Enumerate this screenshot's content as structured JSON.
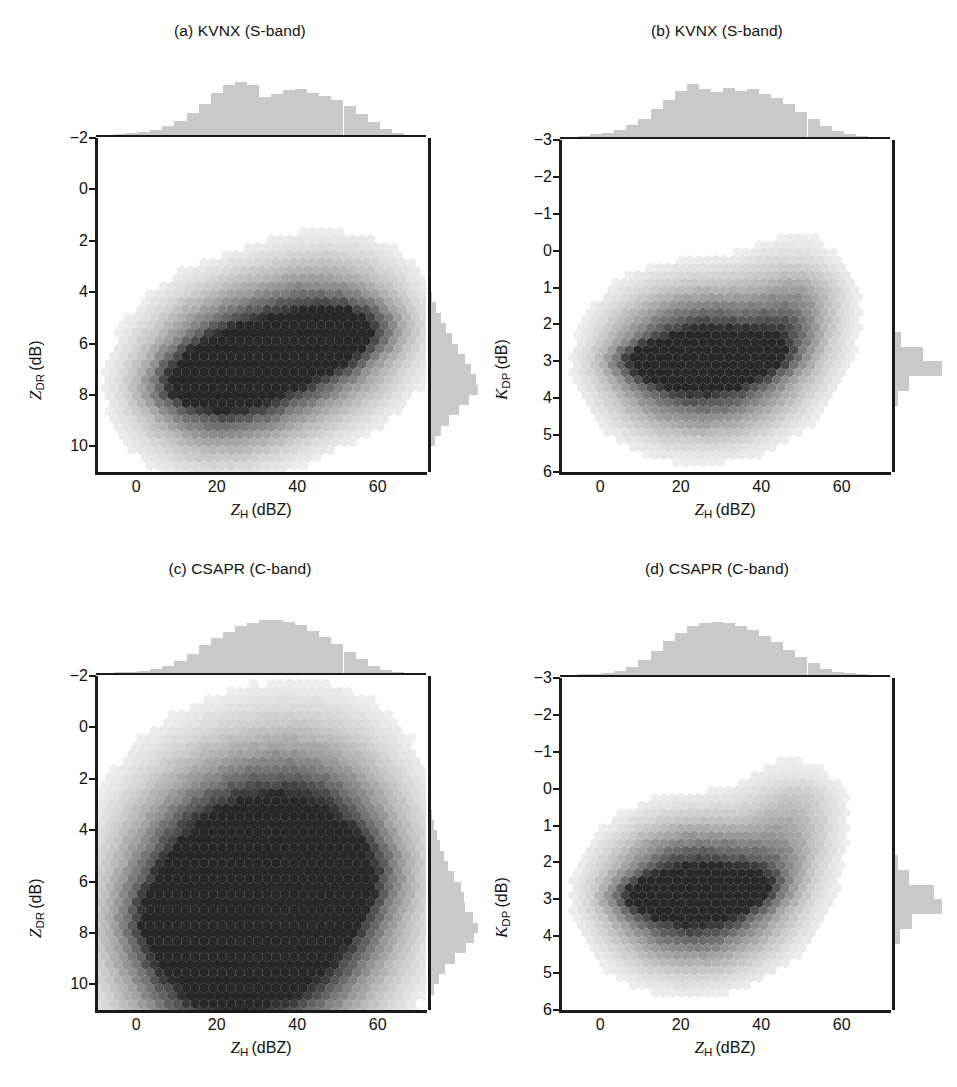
{
  "figure": {
    "caption_prefix": "",
    "panel_count": 4
  },
  "panels": [
    {
      "key": "a",
      "title": "(a) KVNX (S-band)",
      "xlabel_sym": "Z",
      "xlabel_sub": "H",
      "xlabel_unit": "(dBZ)",
      "ylabel_sym": "Z",
      "ylabel_sub": "DR",
      "ylabel_unit": "(dB)",
      "yticks": [
        "10",
        "8",
        "6",
        "4",
        "2",
        "0",
        "−2"
      ],
      "xticks": [
        "0",
        "20",
        "40",
        "60"
      ],
      "annotations": [
        "1",
        "2",
        "3"
      ]
    },
    {
      "key": "b",
      "title": "(b) KVNX (S-band)",
      "xlabel_sym": "Z",
      "xlabel_sub": "H",
      "xlabel_unit": "(dBZ)",
      "ylabel_sym": "K",
      "ylabel_sub": "DP",
      "ylabel_unit": "(dB)",
      "yticks": [
        "6",
        "5",
        "4",
        "3",
        "2",
        "1",
        "0",
        "−1",
        "−2",
        "−3"
      ],
      "xticks": [
        "0",
        "20",
        "40",
        "60"
      ],
      "annotations": [
        "5",
        "4"
      ]
    },
    {
      "key": "c",
      "title": "(c) CSAPR (C-band)",
      "xlabel_sym": "Z",
      "xlabel_sub": "H",
      "xlabel_unit": "(dBZ)",
      "ylabel_sym": "Z",
      "ylabel_sub": "DR",
      "ylabel_unit": "(dB)",
      "yticks": [
        "10",
        "8",
        "6",
        "4",
        "2",
        "0",
        "−2"
      ],
      "xticks": [
        "0",
        "20",
        "40",
        "60"
      ],
      "annotations": [
        "1",
        "2",
        "3"
      ]
    },
    {
      "key": "d",
      "title": "(d) CSAPR (C-band)",
      "xlabel_sym": "Z",
      "xlabel_sub": "H",
      "xlabel_unit": "(dBZ)",
      "ylabel_sym": "K",
      "ylabel_sub": "DP",
      "ylabel_unit": "(dB)",
      "yticks": [
        "6",
        "5",
        "4",
        "3",
        "2",
        "1",
        "0",
        "−1",
        "−2",
        "−3"
      ],
      "xticks": [
        "0",
        "20",
        "40",
        "60"
      ],
      "annotations": [
        "5",
        "4"
      ]
    }
  ],
  "colors": {
    "axis": "#1a1a1a",
    "histogram_fill": "#c9c9c9",
    "density_dark": "#2b2b2b",
    "text": "#111111",
    "background": "#ffffff"
  },
  "chart_data": [
    {
      "id": "a",
      "type": "heatmap",
      "title": "(a) KVNX (S-band)",
      "xlabel": "Z_H (dBZ)",
      "ylabel": "Z_DR (dB)",
      "xlim": [
        -10,
        72
      ],
      "ylim": [
        -3,
        10
      ],
      "xticks": [
        0,
        20,
        40,
        60
      ],
      "yticks": [
        -2,
        0,
        2,
        4,
        6,
        8,
        10
      ],
      "grid": false,
      "description": "2D joint frequency (hexbin) of differential reflectivity vs horizontal reflectivity; elongated ridge rising from (12 dBZ, 0.3 dB) to (58 dBZ, 2.8 dB); densest core near 20-28 dBZ at 0.5-1.2 dB.",
      "ridge_points": [
        {
          "x": 10,
          "y": 0.2,
          "density": 0.1
        },
        {
          "x": 14,
          "y": 0.4,
          "density": 0.3
        },
        {
          "x": 18,
          "y": 0.6,
          "density": 0.62
        },
        {
          "x": 22,
          "y": 0.8,
          "density": 0.95
        },
        {
          "x": 26,
          "y": 1.0,
          "density": 0.88
        },
        {
          "x": 30,
          "y": 1.3,
          "density": 0.66
        },
        {
          "x": 34,
          "y": 1.5,
          "density": 0.58
        },
        {
          "x": 38,
          "y": 1.8,
          "density": 0.62
        },
        {
          "x": 42,
          "y": 2.0,
          "density": 0.7
        },
        {
          "x": 46,
          "y": 2.2,
          "density": 0.6
        },
        {
          "x": 50,
          "y": 2.4,
          "density": 0.42
        },
        {
          "x": 54,
          "y": 2.6,
          "density": 0.26
        },
        {
          "x": 58,
          "y": 2.8,
          "density": 0.12
        }
      ],
      "marginal_x": {
        "label": "Z_H histogram",
        "bin_centers": [
          -4,
          -1,
          2,
          5,
          8,
          11,
          14,
          17,
          20,
          23,
          26,
          29,
          32,
          35,
          38,
          41,
          44,
          47,
          50,
          53,
          56,
          59,
          62,
          65
        ],
        "counts": [
          0.02,
          0.04,
          0.06,
          0.1,
          0.17,
          0.26,
          0.41,
          0.58,
          0.8,
          0.95,
          1.0,
          0.95,
          0.72,
          0.78,
          0.84,
          0.86,
          0.8,
          0.74,
          0.66,
          0.55,
          0.4,
          0.24,
          0.11,
          0.04
        ]
      },
      "marginal_y": {
        "label": "Z_DR histogram",
        "bin_centers": [
          -2.6,
          -2.2,
          -1.8,
          -1.4,
          -1.0,
          -0.6,
          -0.2,
          0.2,
          0.6,
          1.0,
          1.4,
          1.8,
          2.2,
          2.6,
          3.0,
          3.4,
          3.8,
          4.2
        ],
        "counts": [
          0.02,
          0.06,
          0.14,
          0.26,
          0.42,
          0.62,
          0.82,
          1.0,
          0.96,
          0.86,
          0.74,
          0.6,
          0.48,
          0.36,
          0.26,
          0.16,
          0.08,
          0.03
        ]
      },
      "annotations": [
        {
          "label": "1",
          "x": 36,
          "y": 4.4
        },
        {
          "label": "2",
          "x": 53,
          "y": 2.3
        },
        {
          "label": "3",
          "x": 33,
          "y": -1.7
        }
      ]
    },
    {
      "id": "b",
      "type": "heatmap",
      "title": "(b) KVNX (S-band)",
      "xlabel": "Z_H (dBZ)",
      "ylabel": "K_DP (dB)",
      "xlim": [
        -10,
        72
      ],
      "ylim": [
        -3,
        6
      ],
      "xticks": [
        0,
        20,
        40,
        60
      ],
      "yticks": [
        -3,
        -2,
        -1,
        0,
        1,
        2,
        3,
        4,
        5,
        6
      ],
      "grid": false,
      "description": "Joint frequency of specific differential phase vs reflectivity; flat dense band pinned near K_DP = 0 from 12 to 40 dBZ, then a sharp upturn beyond 42 dBZ reaching about 2.2 dB near 50 dBZ.",
      "ridge_points": [
        {
          "x": 8,
          "y": 0.0,
          "density": 0.12
        },
        {
          "x": 13,
          "y": 0.0,
          "density": 0.45
        },
        {
          "x": 17,
          "y": 0.0,
          "density": 0.8
        },
        {
          "x": 21,
          "y": 0.0,
          "density": 0.95
        },
        {
          "x": 25,
          "y": 0.0,
          "density": 0.92
        },
        {
          "x": 29,
          "y": 0.0,
          "density": 1.0
        },
        {
          "x": 33,
          "y": 0.05,
          "density": 0.9
        },
        {
          "x": 37,
          "y": 0.1,
          "density": 0.55
        },
        {
          "x": 41,
          "y": 0.2,
          "density": 0.35
        },
        {
          "x": 44,
          "y": 0.6,
          "density": 0.26
        },
        {
          "x": 46,
          "y": 1.0,
          "density": 0.2
        },
        {
          "x": 48,
          "y": 1.5,
          "density": 0.14
        },
        {
          "x": 50,
          "y": 2.0,
          "density": 0.08
        }
      ],
      "marginal_x": {
        "label": "Z_H histogram",
        "bin_centers": [
          -4,
          -1,
          2,
          5,
          8,
          11,
          14,
          17,
          20,
          23,
          26,
          29,
          32,
          35,
          38,
          41,
          44,
          47,
          50,
          53,
          56,
          59,
          62,
          65
        ],
        "counts": [
          0.02,
          0.05,
          0.08,
          0.14,
          0.22,
          0.34,
          0.52,
          0.7,
          0.86,
          1.0,
          0.9,
          0.84,
          0.92,
          0.86,
          0.9,
          0.82,
          0.74,
          0.62,
          0.48,
          0.34,
          0.2,
          0.11,
          0.05,
          0.02
        ]
      },
      "marginal_y": {
        "label": "K_DP histogram",
        "bin_centers": [
          -1.4,
          -1.0,
          -0.6,
          -0.2,
          0.2,
          0.6,
          1.0,
          1.4
        ],
        "counts": [
          0.04,
          0.12,
          0.34,
          1.0,
          0.62,
          0.18,
          0.06,
          0.02
        ]
      },
      "annotations": [
        {
          "label": "5",
          "x": 48,
          "y": 3.75
        },
        {
          "label": "4",
          "x": 31,
          "y": 1.1
        }
      ]
    },
    {
      "id": "c",
      "type": "heatmap",
      "title": "(c) CSAPR (C-band)",
      "xlabel": "Z_H (dBZ)",
      "ylabel": "Z_DR (dB)",
      "xlim": [
        -10,
        72
      ],
      "ylim": [
        -3,
        10
      ],
      "xticks": [
        0,
        20,
        40,
        60
      ],
      "yticks": [
        -2,
        0,
        2,
        4,
        6,
        8,
        10
      ],
      "grid": false,
      "description": "Broader, more vertically spread C-band distribution; dense core ridge from (12 dBZ, 0.5 dB) to (45 dBZ, 2.0 dB) with a wide diffuse halo extending up to 6 dB and down to -2.5 dB around 30-50 dBZ.",
      "ridge_points": [
        {
          "x": 10,
          "y": 0.4,
          "density": 0.2
        },
        {
          "x": 14,
          "y": 0.5,
          "density": 0.6
        },
        {
          "x": 18,
          "y": 0.6,
          "density": 0.92
        },
        {
          "x": 22,
          "y": 0.7,
          "density": 1.0
        },
        {
          "x": 26,
          "y": 0.9,
          "density": 0.94
        },
        {
          "x": 30,
          "y": 1.1,
          "density": 0.9
        },
        {
          "x": 34,
          "y": 1.3,
          "density": 0.92
        },
        {
          "x": 38,
          "y": 1.6,
          "density": 0.96
        },
        {
          "x": 42,
          "y": 1.9,
          "density": 0.82
        },
        {
          "x": 46,
          "y": 2.1,
          "density": 0.48
        },
        {
          "x": 50,
          "y": 2.3,
          "density": 0.26
        },
        {
          "x": 54,
          "y": 2.4,
          "density": 0.12
        }
      ],
      "marginal_x": {
        "label": "Z_H histogram",
        "bin_centers": [
          -4,
          -1,
          2,
          5,
          8,
          11,
          14,
          17,
          20,
          23,
          26,
          29,
          32,
          35,
          38,
          41,
          44,
          47,
          50,
          53,
          56,
          59,
          62,
          65
        ],
        "counts": [
          0.01,
          0.02,
          0.04,
          0.07,
          0.13,
          0.22,
          0.36,
          0.52,
          0.66,
          0.78,
          0.88,
          0.95,
          1.0,
          1.0,
          0.97,
          0.9,
          0.8,
          0.68,
          0.54,
          0.4,
          0.26,
          0.14,
          0.06,
          0.02
        ]
      },
      "marginal_y": {
        "label": "Z_DR histogram",
        "bin_centers": [
          -2.6,
          -2.2,
          -1.8,
          -1.4,
          -1.0,
          -0.6,
          -0.2,
          0.2,
          0.6,
          1.0,
          1.4,
          1.8,
          2.2,
          2.6,
          3.0,
          3.4,
          3.8,
          4.2,
          4.6,
          5.0,
          5.4
        ],
        "counts": [
          0.05,
          0.12,
          0.22,
          0.34,
          0.54,
          0.76,
          0.92,
          1.0,
          0.9,
          0.74,
          0.72,
          0.66,
          0.52,
          0.4,
          0.32,
          0.24,
          0.18,
          0.12,
          0.08,
          0.04,
          0.02
        ]
      },
      "annotations": [
        {
          "label": "1",
          "x": 36,
          "y": 4.4
        },
        {
          "label": "2",
          "x": 53,
          "y": 2.3
        },
        {
          "label": "3",
          "x": 34,
          "y": -1.9
        }
      ]
    },
    {
      "id": "d",
      "type": "heatmap",
      "title": "(d) CSAPR (C-band)",
      "xlabel": "Z_H (dBZ)",
      "ylabel": "K_DP (dB)",
      "xlim": [
        -10,
        72
      ],
      "ylim": [
        -3,
        6
      ],
      "xticks": [
        0,
        20,
        40,
        60
      ],
      "yticks": [
        -3,
        -2,
        -1,
        0,
        1,
        2,
        3,
        4,
        5,
        6
      ],
      "grid": false,
      "description": "Dense flat band near K_DP = 0.1 dB spanning 10-40 dBZ with faint diffuse upturn toward 3 dB above 44 dBZ; weaker and more diffuse than the S-band counterpart.",
      "ridge_points": [
        {
          "x": 9,
          "y": 0.05,
          "density": 0.15
        },
        {
          "x": 13,
          "y": 0.1,
          "density": 0.5
        },
        {
          "x": 17,
          "y": 0.1,
          "density": 0.84
        },
        {
          "x": 21,
          "y": 0.1,
          "density": 1.0
        },
        {
          "x": 25,
          "y": 0.1,
          "density": 0.96
        },
        {
          "x": 29,
          "y": 0.15,
          "density": 0.88
        },
        {
          "x": 33,
          "y": 0.2,
          "density": 0.62
        },
        {
          "x": 37,
          "y": 0.3,
          "density": 0.36
        },
        {
          "x": 41,
          "y": 0.7,
          "density": 0.22
        },
        {
          "x": 44,
          "y": 1.3,
          "density": 0.16
        },
        {
          "x": 47,
          "y": 2.0,
          "density": 0.1
        },
        {
          "x": 49,
          "y": 2.7,
          "density": 0.06
        }
      ],
      "marginal_x": {
        "label": "Z_H histogram",
        "bin_centers": [
          -4,
          -1,
          2,
          5,
          8,
          11,
          14,
          17,
          20,
          23,
          26,
          29,
          32,
          35,
          38,
          41,
          44,
          47,
          50,
          53,
          56,
          59,
          62,
          65
        ],
        "counts": [
          0.01,
          0.02,
          0.04,
          0.08,
          0.16,
          0.28,
          0.46,
          0.64,
          0.8,
          0.92,
          0.98,
          1.0,
          0.98,
          0.92,
          0.84,
          0.74,
          0.62,
          0.48,
          0.34,
          0.22,
          0.12,
          0.06,
          0.03,
          0.01
        ]
      },
      "marginal_y": {
        "label": "K_DP histogram",
        "bin_centers": [
          -1.4,
          -1.0,
          -0.6,
          -0.2,
          0.2,
          0.6,
          1.0,
          1.4
        ],
        "counts": [
          0.06,
          0.16,
          0.4,
          1.0,
          0.84,
          0.34,
          0.12,
          0.04
        ]
      },
      "annotations": [
        {
          "label": "5",
          "x": 48,
          "y": 3.8
        },
        {
          "label": "4",
          "x": 32,
          "y": 1.3
        }
      ]
    }
  ]
}
